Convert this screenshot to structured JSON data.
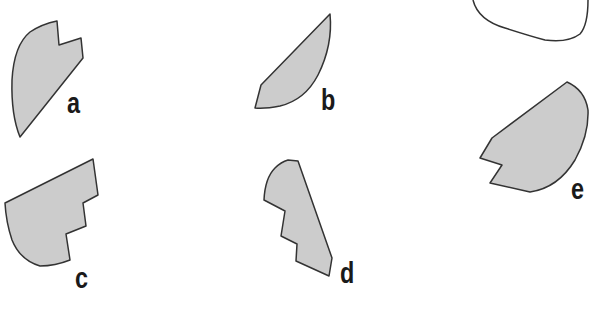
{
  "diagram": {
    "fill_color": "#cccccc",
    "stroke_color": "#333333",
    "background": "#ffffff",
    "shapes": [
      {
        "id": "a",
        "label": "a",
        "label_x": 67,
        "label_y": 88,
        "path": "M57,21 L59,45 L81,38 L83,58 L20,137 Q11,115 12,80 Q14,45 30,32 Q42,24 57,21 Z"
      },
      {
        "id": "b",
        "label": "b",
        "label_x": 321,
        "label_y": 85,
        "path": "M330,14 Q333,45 318,75 Q305,100 280,106 Q265,109 255,108 L261,85 Z"
      },
      {
        "id": "c",
        "label": "c",
        "label_x": 75,
        "label_y": 263,
        "path": "M93,159 L98,195 L83,203 L86,226 L66,234 L70,260 Q55,266 40,266 Q20,260 12,240 Q6,222 5,203 Z"
      },
      {
        "id": "d",
        "label": "d",
        "label_x": 340,
        "label_y": 258,
        "path": "M288,160 L298,161 L332,258 L329,276 L296,261 L297,244 L281,236 L285,211 L264,200 Q265,178 275,168 Q281,162 288,160 Z"
      },
      {
        "id": "e",
        "label": "e",
        "label_x": 571,
        "label_y": 174,
        "path": "M567,82 Q585,90 588,110 Q589,135 575,160 Q558,188 530,192 L490,183 L502,165 L480,158 L492,138 Z"
      }
    ],
    "open_curve": {
      "id": "top-right-outline",
      "path": "M473,0 Q478,20 505,28 Q530,36 545,40 Q568,43 580,34 Q588,25 588,0"
    }
  }
}
